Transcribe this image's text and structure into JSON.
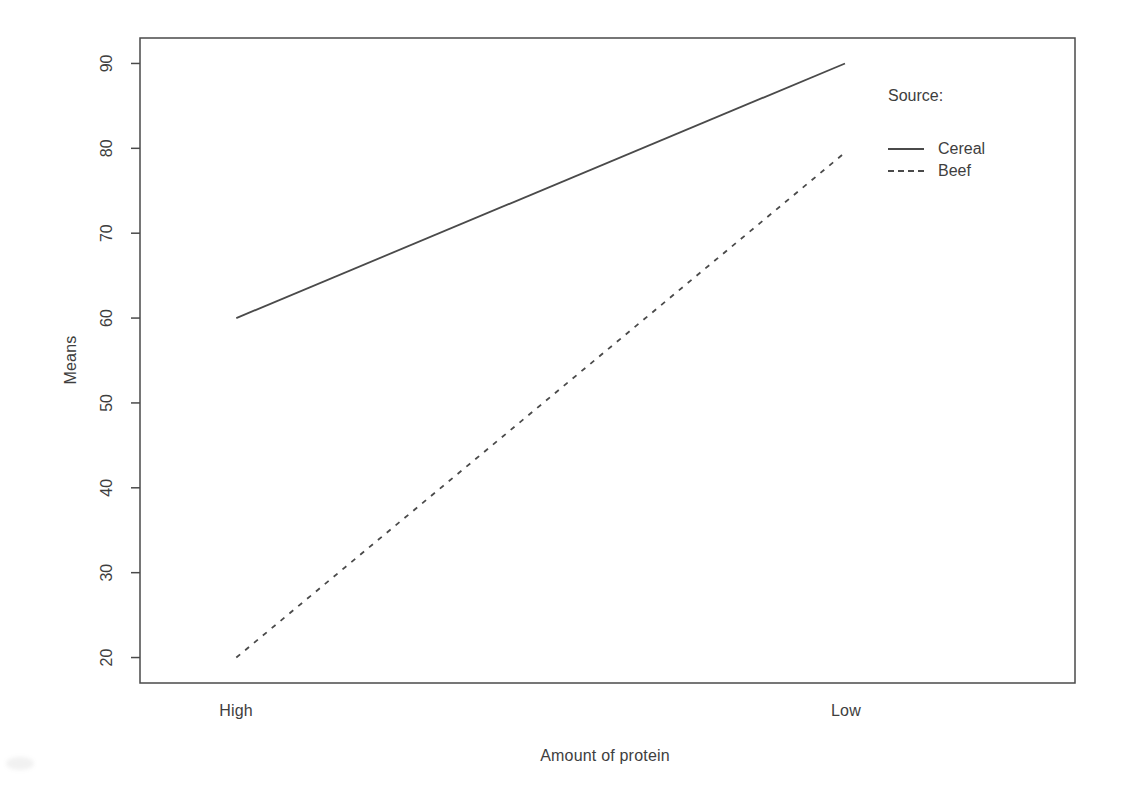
{
  "figure": {
    "background": "#ffffff",
    "text_color": "#3e3e3e",
    "line_color": "#4a4a4a"
  },
  "chart_data": {
    "type": "line",
    "categories": [
      "High",
      "Low"
    ],
    "series": [
      {
        "name": "Cereal",
        "line_style": "solid",
        "values": [
          60,
          90
        ]
      },
      {
        "name": "Beef",
        "line_style": "dashed",
        "values": [
          20,
          79.5
        ]
      }
    ],
    "title": "",
    "xlabel": "Amount of protein",
    "ylabel": "Means",
    "yticks": [
      20,
      30,
      40,
      50,
      60,
      70,
      80,
      90
    ],
    "ylim": [
      17,
      93
    ],
    "grid": false,
    "legend": {
      "title": "Source:",
      "position": "top-right-inside",
      "entries": [
        "Cereal",
        "Beef"
      ]
    },
    "x_positions_frac": [
      0.103,
      0.754
    ]
  }
}
